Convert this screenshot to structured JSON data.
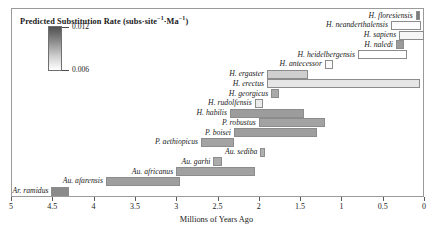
{
  "figure": {
    "xlabel": "Millions of Years Ago",
    "legend_title_main": "Predicted Substitution Rate (subs·site",
    "legend_title_sup1": "−1",
    "legend_title_mid": "·Ma",
    "legend_title_sup2": "−1",
    "legend_title_end": ")",
    "legend_max": "0.012",
    "legend_min": "0.006",
    "axis_ticks": [
      "5",
      "4.5",
      "4",
      "3.5",
      "3",
      "2.5",
      "2",
      "1.5",
      "1",
      "0.5",
      "0"
    ]
  },
  "chart_data": {
    "type": "bar",
    "orientation": "horizontal-range",
    "title": "",
    "xlabel": "Millions of Years Ago",
    "ylabel": "",
    "xlim": [
      5.0,
      0.0
    ],
    "x_axis_reversed": true,
    "xticks": [
      5,
      4.5,
      4,
      3.5,
      3,
      2.5,
      2,
      1.5,
      1,
      0.5,
      0
    ],
    "grid": false,
    "legend_position": "top-left-inset",
    "colorbar": {
      "label": "Predicted Substitution Rate (subs·site⁻¹·Ma⁻¹)",
      "min": 0.006,
      "max": 0.012,
      "colormap": "grayscale-reversed",
      "min_color": "#ffffff",
      "max_color": "#4f4f4f"
    },
    "categories": [
      "H. floresiensis",
      "H. neanderthalensis",
      "H. sapiens",
      "H. naledi",
      "H. heidelbergensis",
      "H. antecessor",
      "H. ergaster",
      "H. erectus",
      "H. georgicus",
      "H. rudolfensis",
      "H. habilis",
      "P. robustus",
      "P. boisei",
      "P. aethiopicus",
      "Au. sediba",
      "Au. garhi",
      "Au. africanus",
      "Au. afarensis",
      "Ar. ramidus"
    ],
    "bars": [
      {
        "taxon": "H. floresiensis",
        "start_mya": 0.1,
        "end_mya": 0.05,
        "rate": 0.0118,
        "color": "#7d7d7d"
      },
      {
        "taxon": "H. neanderthalensis",
        "start_mya": 0.4,
        "end_mya": 0.04,
        "rate": 0.0061,
        "color": "#fdfdfd"
      },
      {
        "taxon": "H. sapiens",
        "start_mya": 0.3,
        "end_mya": 0.0,
        "rate": 0.0063,
        "color": "#f6f6f6"
      },
      {
        "taxon": "H. naledi",
        "start_mya": 0.34,
        "end_mya": 0.24,
        "rate": 0.0105,
        "color": "#9a9a9a"
      },
      {
        "taxon": "H. heidelbergensis",
        "start_mya": 0.8,
        "end_mya": 0.2,
        "rate": 0.006,
        "color": "#ffffff"
      },
      {
        "taxon": "H. antecessor",
        "start_mya": 1.2,
        "end_mya": 1.1,
        "rate": 0.0062,
        "color": "#fbfbfb"
      },
      {
        "taxon": "H. ergaster",
        "start_mya": 1.9,
        "end_mya": 1.4,
        "rate": 0.0082,
        "color": "#cfcfcf"
      },
      {
        "taxon": "H. erectus",
        "start_mya": 1.9,
        "end_mya": 0.05,
        "rate": 0.0072,
        "color": "#e6e6e6"
      },
      {
        "taxon": "H. georgicus",
        "start_mya": 1.85,
        "end_mya": 1.75,
        "rate": 0.0098,
        "color": "#a9a9a9"
      },
      {
        "taxon": "H. rudolfensis",
        "start_mya": 2.05,
        "end_mya": 1.95,
        "rate": 0.007,
        "color": "#ebebeb"
      },
      {
        "taxon": "H. habilis",
        "start_mya": 2.35,
        "end_mya": 1.45,
        "rate": 0.0104,
        "color": "#9c9c9c"
      },
      {
        "taxon": "P. robustus",
        "start_mya": 2.0,
        "end_mya": 1.2,
        "rate": 0.01,
        "color": "#a3a3a3"
      },
      {
        "taxon": "P. boisei",
        "start_mya": 2.3,
        "end_mya": 1.3,
        "rate": 0.0103,
        "color": "#9e9e9e"
      },
      {
        "taxon": "P. aethiopicus",
        "start_mya": 2.7,
        "end_mya": 2.3,
        "rate": 0.01,
        "color": "#a3a3a3"
      },
      {
        "taxon": "Au. sediba",
        "start_mya": 1.98,
        "end_mya": 1.93,
        "rate": 0.0095,
        "color": "#b0b0b0"
      },
      {
        "taxon": "Au. garhi",
        "start_mya": 2.55,
        "end_mya": 2.45,
        "rate": 0.0097,
        "color": "#ababab"
      },
      {
        "taxon": "Au. africanus",
        "start_mya": 3.0,
        "end_mya": 2.05,
        "rate": 0.0101,
        "color": "#a1a1a1"
      },
      {
        "taxon": "Au. afarensis",
        "start_mya": 3.85,
        "end_mya": 2.95,
        "rate": 0.0103,
        "color": "#9e9e9e"
      },
      {
        "taxon": "Ar. ramidus",
        "start_mya": 4.51,
        "end_mya": 4.3,
        "rate": 0.0112,
        "color": "#8a8a8a"
      }
    ]
  }
}
